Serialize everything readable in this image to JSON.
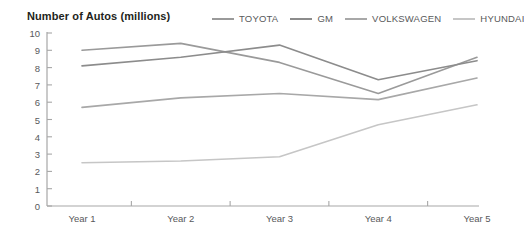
{
  "chart_data": {
    "type": "line",
    "title": "Number of Autos (millions)",
    "xlabel": "",
    "ylabel": "",
    "categories": [
      "Year 1",
      "Year 2",
      "Year 3",
      "Year 4",
      "Year 5"
    ],
    "ylim": [
      0,
      10
    ],
    "y_ticks": [
      0,
      1,
      2,
      3,
      4,
      5,
      6,
      7,
      8,
      9,
      10
    ],
    "grid": false,
    "legend_position": "top-right",
    "series": [
      {
        "name": "TOYOTA",
        "color": "#9a9a9a",
        "values": [
          9.0,
          9.4,
          8.3,
          6.5,
          8.6
        ]
      },
      {
        "name": "GM",
        "color": "#8c8c8c",
        "values": [
          8.1,
          8.6,
          9.3,
          7.3,
          8.4
        ]
      },
      {
        "name": "VOLKSWAGEN",
        "color": "#a8a8a8",
        "values": [
          5.7,
          6.25,
          6.5,
          6.15,
          7.4
        ]
      },
      {
        "name": "HYUNDAI",
        "color": "#c6c6c6",
        "values": [
          2.5,
          2.6,
          2.85,
          4.7,
          5.85
        ]
      }
    ]
  },
  "axis": {
    "line_color": "#a7a7a7",
    "tick_color": "#a7a7a7"
  }
}
